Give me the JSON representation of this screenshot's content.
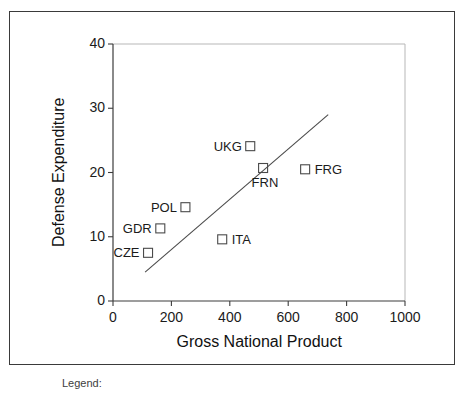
{
  "figure": {
    "legend_caption": "Legend:"
  },
  "chart_data": {
    "type": "scatter",
    "title": "",
    "xlabel": "Gross National Product",
    "ylabel": "Defense Expenditure",
    "xlim": [
      0,
      1000
    ],
    "ylim": [
      0,
      40
    ],
    "xticks": [
      0,
      200,
      400,
      600,
      800,
      1000
    ],
    "yticks": [
      0,
      10,
      20,
      30,
      40
    ],
    "xtick_labels": [
      "0",
      "200",
      "400",
      "600",
      "800",
      "1000"
    ],
    "ytick_labels": [
      "0",
      "10",
      "20",
      "30",
      "40"
    ],
    "grid": false,
    "legend": "none",
    "marker": "open-square",
    "marker_color": "#4a4a4a",
    "line_color": "#4a4a4a",
    "points": [
      {
        "label": "CZE",
        "x": 120,
        "y": 7.5,
        "label_side": "left"
      },
      {
        "label": "GDR",
        "x": 162,
        "y": 11.3,
        "label_side": "left"
      },
      {
        "label": "POL",
        "x": 248,
        "y": 14.6,
        "label_side": "left"
      },
      {
        "label": "ITA",
        "x": 374,
        "y": 9.6,
        "label_side": "right"
      },
      {
        "label": "UKG",
        "x": 470,
        "y": 24.1,
        "label_side": "left"
      },
      {
        "label": "FRN",
        "x": 514,
        "y": 20.7,
        "label_side": "below"
      },
      {
        "label": "FRG",
        "x": 658,
        "y": 20.5,
        "label_side": "right"
      }
    ],
    "trend_line": {
      "x0": 110,
      "y0": 4.5,
      "x1": 737,
      "y1": 29.0
    }
  }
}
